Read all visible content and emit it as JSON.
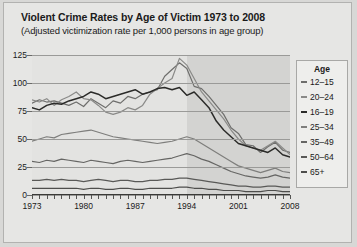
{
  "chart_data": {
    "type": "line",
    "title": "Violent Crime Rates by Age of Victim 1973 to 2008",
    "subtitle": "(Adjusted victimization rate per 1,000 persons in age group)",
    "xlabel": "",
    "ylabel": "",
    "xlim": [
      1973,
      2008
    ],
    "ylim": [
      0,
      125
    ],
    "yticks": [
      0,
      25,
      50,
      75,
      100,
      125
    ],
    "xticks": [
      1973,
      1980,
      1987,
      1994,
      2001,
      2008
    ],
    "grid": true,
    "legend_title": "Age",
    "legend_position": "right",
    "shaded_region": {
      "from": 1994,
      "to": 2008
    },
    "x": [
      1973,
      1974,
      1975,
      1976,
      1977,
      1978,
      1979,
      1980,
      1981,
      1982,
      1983,
      1984,
      1985,
      1986,
      1987,
      1988,
      1989,
      1990,
      1991,
      1992,
      1993,
      1994,
      1995,
      1996,
      1997,
      1998,
      1999,
      2000,
      2001,
      2002,
      2003,
      2004,
      2005,
      2006,
      2007,
      2008
    ],
    "series": [
      {
        "name": "12–15",
        "color": "#6e6e6c",
        "values": [
          82,
          85,
          83,
          84,
          82,
          80,
          83,
          79,
          86,
          82,
          78,
          84,
          82,
          88,
          86,
          90,
          92,
          94,
          106,
          112,
          118,
          113,
          97,
          95,
          88,
          80,
          72,
          60,
          55,
          45,
          44,
          38,
          43,
          47,
          40,
          38
        ]
      },
      {
        "name": "20–24",
        "color": "#8a8a88",
        "values": [
          85,
          83,
          86,
          80,
          85,
          88,
          92,
          86,
          85,
          80,
          74,
          72,
          74,
          78,
          76,
          80,
          90,
          95,
          100,
          104,
          122,
          116,
          104,
          92,
          84,
          76,
          68,
          58,
          50,
          44,
          42,
          40,
          44,
          48,
          42,
          36
        ]
      },
      {
        "name": "16–19",
        "color": "#2b2b29",
        "values": [
          78,
          76,
          80,
          82,
          81,
          84,
          86,
          88,
          92,
          90,
          86,
          88,
          90,
          92,
          94,
          90,
          92,
          95,
          96,
          94,
          96,
          89,
          92,
          85,
          78,
          66,
          58,
          52,
          46,
          44,
          42,
          40,
          38,
          42,
          36,
          34
        ]
      },
      {
        "name": "25–34",
        "color": "#7e7e7c",
        "values": [
          48,
          50,
          52,
          51,
          54,
          55,
          56,
          57,
          58,
          56,
          54,
          52,
          51,
          50,
          49,
          48,
          47,
          46,
          47,
          48,
          50,
          52,
          50,
          46,
          42,
          38,
          34,
          30,
          26,
          24,
          22,
          20,
          22,
          24,
          21,
          20
        ]
      },
      {
        "name": "35–49",
        "color": "#666664",
        "values": [
          30,
          29,
          31,
          30,
          32,
          31,
          30,
          29,
          31,
          30,
          29,
          28,
          30,
          31,
          30,
          29,
          30,
          31,
          32,
          33,
          35,
          37,
          35,
          32,
          30,
          27,
          24,
          21,
          19,
          17,
          16,
          15,
          16,
          18,
          16,
          15
        ]
      },
      {
        "name": "50–64",
        "color": "#595957",
        "values": [
          13,
          13,
          14,
          13,
          14,
          13,
          13,
          12,
          13,
          14,
          13,
          12,
          13,
          13,
          12,
          12,
          13,
          13,
          14,
          14,
          15,
          15,
          14,
          13,
          12,
          11,
          10,
          9,
          8,
          8,
          7,
          7,
          8,
          8,
          7,
          7
        ]
      },
      {
        "name": "65+",
        "color": "#4e4e4c",
        "values": [
          6,
          6,
          6,
          6,
          6,
          6,
          6,
          5,
          6,
          6,
          5,
          5,
          6,
          6,
          5,
          5,
          6,
          6,
          6,
          6,
          7,
          7,
          6,
          6,
          5,
          5,
          4,
          4,
          4,
          3,
          3,
          3,
          4,
          4,
          3,
          3
        ]
      }
    ]
  }
}
